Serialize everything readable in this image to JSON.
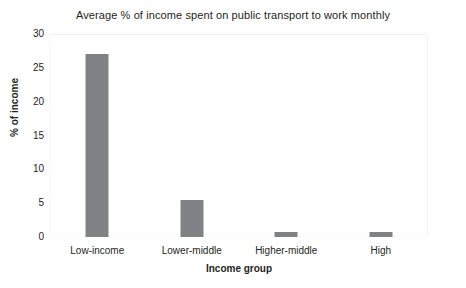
{
  "chart_data": {
    "type": "bar",
    "title": "Average % of income spent on public transport to work monthly",
    "xlabel": "Income group",
    "ylabel": "% of income",
    "categories": [
      "Low-income",
      "Lower-middle",
      "Higher-middle",
      "High"
    ],
    "values": [
      27.0,
      5.5,
      0.8,
      0.7
    ],
    "ylim": [
      0,
      30
    ],
    "yticks": [
      0,
      5,
      10,
      15,
      20,
      25,
      30
    ],
    "ytick_labels": [
      "0",
      "5",
      "10",
      "15",
      "20",
      "25",
      "30"
    ],
    "grid": false,
    "legend": "none",
    "bar_color": "#808285",
    "background_color": "#ffffff",
    "text_color": "#231f20"
  }
}
